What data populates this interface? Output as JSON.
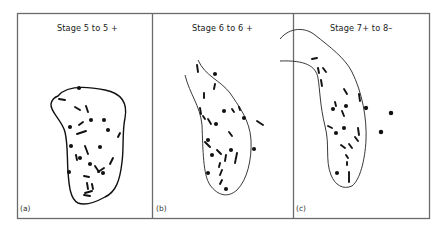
{
  "figure": {
    "type": "three-panel schematic diagram",
    "frame_color": "#6b6b6b",
    "ink_color": "#111111",
    "panels": [
      {
        "id": "a",
        "label": "(a)",
        "title": "Stage 5 to 5 +",
        "outline": "closed kidney-shaped boundary",
        "marks": "short arrows and dots scattered inside boundary"
      },
      {
        "id": "b",
        "label": "(b)",
        "title": "Stage 6 to 6 +",
        "outline": "open elongated boundary, open at top-left",
        "marks": "short arrows and dots inside, a few outside to the right"
      },
      {
        "id": "c",
        "label": "(c)",
        "title": "Stage 7+ to 8–",
        "outline": "elongated curved boundary extending into panel (b) at top-left",
        "marks": "short arrows and dots inside, a few dots outside to the right"
      }
    ]
  }
}
